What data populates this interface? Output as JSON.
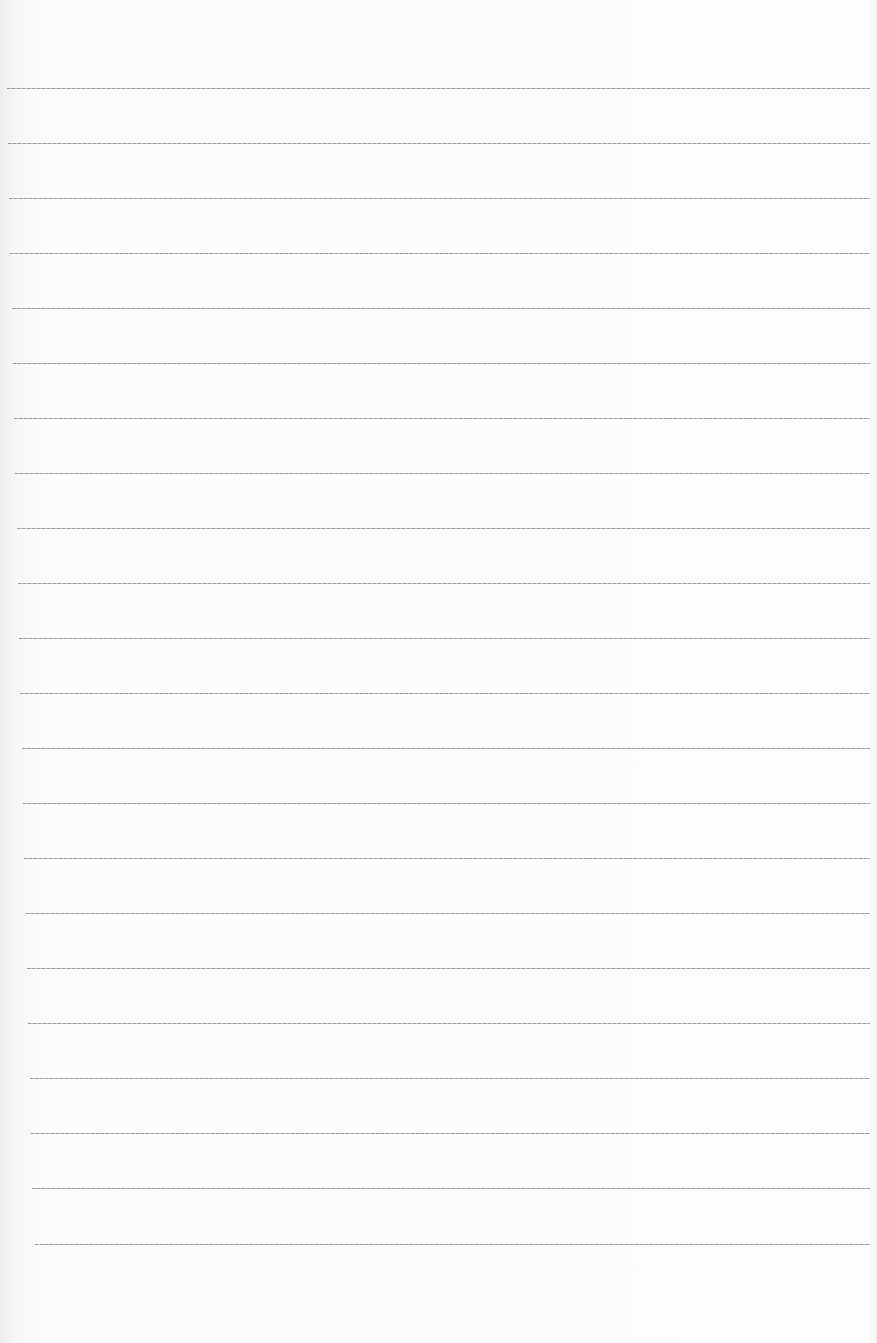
{
  "document": {
    "type": "lined-paper",
    "lines": [
      {
        "y": 88,
        "x": 7
      },
      {
        "y": 143,
        "x": 8
      },
      {
        "y": 198,
        "x": 9
      },
      {
        "y": 253,
        "x": 10
      },
      {
        "y": 308,
        "x": 12
      },
      {
        "y": 363,
        "x": 13
      },
      {
        "y": 418,
        "x": 14
      },
      {
        "y": 473,
        "x": 15
      },
      {
        "y": 528,
        "x": 17
      },
      {
        "y": 583,
        "x": 18
      },
      {
        "y": 638,
        "x": 19
      },
      {
        "y": 693,
        "x": 20
      },
      {
        "y": 748,
        "x": 22
      },
      {
        "y": 803,
        "x": 23
      },
      {
        "y": 858,
        "x": 24
      },
      {
        "y": 913,
        "x": 26
      },
      {
        "y": 968,
        "x": 27
      },
      {
        "y": 1023,
        "x": 28
      },
      {
        "y": 1078,
        "x": 30
      },
      {
        "y": 1133,
        "x": 31
      },
      {
        "y": 1188,
        "x": 32
      },
      {
        "y": 1244,
        "x": 35
      }
    ],
    "right_edge": 870,
    "line_color": "#999999"
  }
}
